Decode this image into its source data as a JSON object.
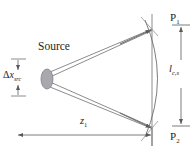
{
  "figure": {
    "name": "source-coherence-propagation-diagram",
    "type": "optical-ray-schematic",
    "background_color": "#ffffff",
    "line_color": "#58595b",
    "text_color": "#231f20",
    "source_fill_color": "#a7a9ac"
  },
  "labels": {
    "source": "Source",
    "delta_x_src_symbol": "Δ",
    "delta_x_src_var": "x",
    "delta_x_src_sub": "src",
    "p1": "P",
    "p1_sub": "1",
    "p2": "P",
    "p2_sub": "2",
    "lcs_var": "l",
    "lcs_sub": "c,s",
    "z1_var": "z",
    "z1_sub": "1"
  },
  "geometry": {
    "source_center_x": 47,
    "source_center_y": 79,
    "source_rx": 6,
    "source_ry": 10,
    "p1_x": 152,
    "p1_y": 29,
    "p2_x": 152,
    "p2_y": 128,
    "screen_line_x": 152,
    "screen_top_y": 14,
    "screen_bottom_y": 143,
    "arc_bulge_x": 167,
    "dim_lcs_x": 180,
    "dim_z1_y": 135,
    "dim_z1_left_x": 17,
    "dim_z1_right_x": 152,
    "dim_dx_x": 18,
    "dim_dx_top_y": 59,
    "dim_dx_bottom_y": 96
  },
  "annotations": {
    "delta_x_src_meaning": "source transverse size",
    "lcs_meaning": "transverse coherence length at screen",
    "z1_meaning": "propagation distance from source to screen"
  }
}
